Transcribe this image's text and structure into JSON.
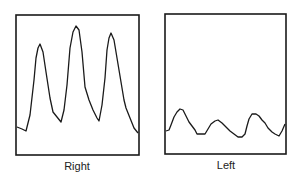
{
  "figure": {
    "panels": [
      {
        "label": "Right",
        "box": {
          "x": 16,
          "y": 15,
          "w": 123,
          "h": 140
        },
        "waveform": "M17,127 L22,129 L26,131 L30,115 L34,80 L36,58 L38,48 L40,44 L43,52 L46,72 L50,98 L53,112 L57,117 L61,122 L64,110 L67,85 L70,48 L73,32 L76,26 L79,30 L82,52 L85,87 L89,100 L93,110 L97,118 L99,121 L102,105 L105,78 L107,50 L109,38 L111,33 L114,40 L117,58 L121,82 L124,100 L126,108 L130,118 L134,128 L138,133"
      },
      {
        "label": "Left",
        "box": {
          "x": 165,
          "y": 14,
          "w": 121,
          "h": 140
        },
        "waveform": "M166,131 L169,130 L171,125 L174,117 L177,112 L180,109 L183,110 L186,116 L189,122 L192,126 L195,130 L197,134 L201,134 L205,134 L208,129 L211,124 L215,121 L218,120 L222,123 L226,127 L230,131 L234,134 L238,137 L242,137 L245,134 L247,126 L249,119 L252,114 L256,114 L259,116 L262,120 L265,123 L268,128 L272,132 L275,134 L279,136 L282,131 L285,124"
      }
    ],
    "colors": {
      "line": "#1a1a1a",
      "background": "#ffffff"
    }
  }
}
